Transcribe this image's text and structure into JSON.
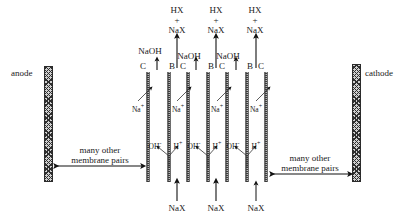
{
  "diagram": {
    "electrodes": {
      "anode_label": "anode",
      "cathode_label": "cathode"
    },
    "membrane_labels": [
      "C",
      "B",
      "C",
      "B",
      "C",
      "B",
      "C"
    ],
    "membrane_types": {
      "C": "cation-exchange membrane",
      "B": "bipolar membrane"
    },
    "top_outputs": [
      {
        "line1": "HX",
        "plus": "+",
        "line2": "NaX"
      },
      {
        "line1": "HX",
        "plus": "+",
        "line2": "NaX"
      },
      {
        "line1": "HX",
        "plus": "+",
        "line2": "NaX"
      }
    ],
    "base_outputs": [
      {
        "label": "NaOH"
      },
      {
        "label": "NaOH"
      },
      {
        "label": "NaOH"
      }
    ],
    "bottom_feeds": [
      {
        "label": "NaX"
      },
      {
        "label": "NaX"
      },
      {
        "label": "NaX"
      }
    ],
    "cation_transport": [
      {
        "ion": "Na",
        "charge": "+"
      },
      {
        "ion": "Na",
        "charge": "+"
      },
      {
        "ion": "Na",
        "charge": "+"
      },
      {
        "ion": "Na",
        "charge": "+"
      }
    ],
    "water_splitting": [
      {
        "anion": "OH",
        "anion_charge": "-",
        "cation": "H",
        "cation_charge": "+"
      },
      {
        "anion": "OH",
        "anion_charge": "-",
        "cation": "H",
        "cation_charge": "+"
      },
      {
        "anion": "OH",
        "anion_charge": "-",
        "cation": "H",
        "cation_charge": "+"
      }
    ],
    "repeat_notes": [
      {
        "line1": "many other",
        "line2": "membrane pairs"
      },
      {
        "line1": "many other",
        "line2": "membrane pairs"
      }
    ],
    "colors": {
      "ink": "#1a1a1a",
      "electrode_fill": "#cfcfcf",
      "membrane_fill": "#b9b9b9",
      "background": "#ffffff"
    }
  }
}
